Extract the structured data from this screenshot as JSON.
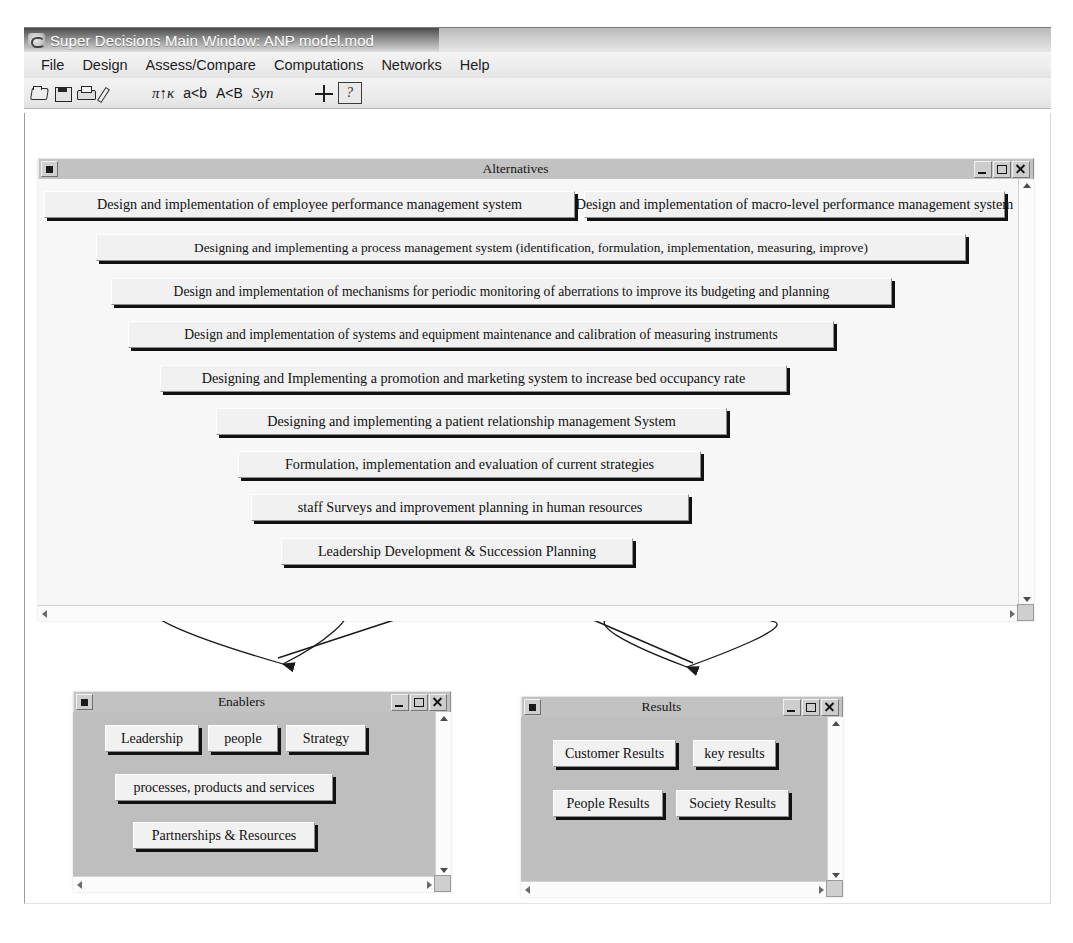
{
  "window": {
    "title": "Super Decisions Main Window: ANP model.mod",
    "app_icon": "superdecisions-logo-icon"
  },
  "menubar": {
    "items": [
      "File",
      "Design",
      "Assess/Compare",
      "Computations",
      "Networks",
      "Help"
    ]
  },
  "toolbar": {
    "icons": [
      "open-folder-icon",
      "save-disk-icon",
      "print-icon",
      "pencil-icon"
    ],
    "texts": [
      "π↑κ",
      "a<b",
      "A<B",
      "Syn"
    ],
    "cross_icon": "crosshair-icon",
    "help_icon": "help-page-icon",
    "help_glyph": "?"
  },
  "windows": {
    "alternatives": {
      "title": "Alternatives",
      "controls": {
        "system": "system-menu-box",
        "minimize": "–",
        "maximize": "□",
        "close": "×"
      },
      "nodes": [
        "Design and implementation of employee performance management system",
        "Design and implementation of macro-level performance management system",
        "Designing and implementing a process management system  (identification, formulation, implementation, measuring, improve)",
        "Design and implementation of mechanisms for periodic monitoring of aberrations to improve its budgeting and planning",
        "Design and implementation of systems and equipment maintenance and calibration of measuring instruments",
        "Designing and Implementing a promotion and marketing system to  increase bed occupancy rate",
        "Designing and implementing a patient relationship management System",
        "Formulation, implementation and evaluation of current strategies",
        "staff Surveys and improvement planning in human resources",
        "Leadership Development & Succession Planning"
      ]
    },
    "enablers": {
      "title": "Enablers",
      "nodes": [
        "Leadership",
        "people",
        "Strategy",
        "processes, products and services",
        "Partnerships & Resources"
      ]
    },
    "results": {
      "title": "Results",
      "nodes": [
        "Customer Results",
        "key results",
        "People Results",
        "Society Results"
      ]
    }
  },
  "links": {
    "enablers_to_alternatives": "arrow-enablers-to-alternatives",
    "results_to_alternatives": "arrow-results-to-alternatives",
    "enablers_self_loop": "self-loop-enablers",
    "results_self_loop": "self-loop-results"
  },
  "colors": {
    "titlebar_text": "#ffffff",
    "mdi_titlebar": "#c2c2c2",
    "node_face": "#f1f1f1",
    "node_shadow": "#111111",
    "desktop": "#ffffff"
  }
}
